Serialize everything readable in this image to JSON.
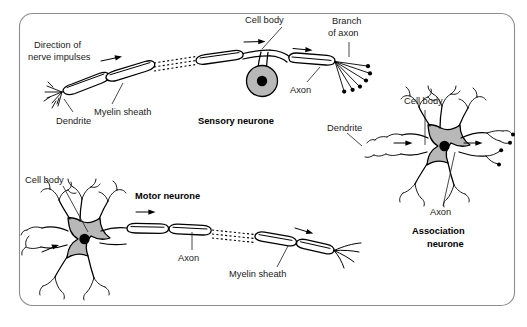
{
  "figure": {
    "background_color": "#ffffff",
    "frame_color": "#8d8d93",
    "ink_color": "#000000",
    "soma_fill_color": "#b8b8b8",
    "nucleus_color": "#000000"
  },
  "labels": {
    "direction_of_nerve_impulses_line1": "Direction of",
    "direction_of_nerve_impulses_line2": "nerve impulses",
    "myelin_sheath_sensory": "Myelin sheath",
    "dendrite_sensory": "Dendrite",
    "cell_body_sensory": "Cell body",
    "branch_of_axon_line1": "Branch",
    "branch_of_axon_line2": "of axon",
    "axon_sensory": "Axon",
    "sensory_neurone": "Sensory neurone",
    "cell_body_association": "Cell body",
    "dendrite_association": "Dendrite",
    "axon_association": "Axon",
    "association_neurone_line1": "Association",
    "association_neurone_line2": "neurone",
    "cell_body_motor": "Cell body",
    "motor_neurone": "Motor neurone",
    "axon_motor": "Axon",
    "myelin_sheath_motor": "Myelin sheath"
  },
  "neurones": [
    {
      "name": "sensory-neurone",
      "title": "Sensory neurone",
      "parts": [
        "Dendrite",
        "Myelin sheath",
        "Cell body",
        "Axon",
        "Branch of axon"
      ],
      "impulse_direction": "left-to-right",
      "soma_shape": "round",
      "soma_position": "side-branch below axon"
    },
    {
      "name": "association-neurone",
      "title": "Association neurone",
      "parts": [
        "Dendrite",
        "Cell body",
        "Axon"
      ],
      "impulse_direction": "left-to-right",
      "soma_shape": "star",
      "soma_position": "central"
    },
    {
      "name": "motor-neurone",
      "title": "Motor neurone",
      "parts": [
        "Cell body",
        "Axon",
        "Myelin sheath"
      ],
      "impulse_direction": "left-to-right",
      "soma_shape": "star",
      "soma_position": "left end"
    }
  ]
}
